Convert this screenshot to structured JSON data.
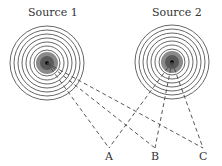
{
  "sources": [
    {
      "label": "Source 1",
      "cx": 47,
      "cy": 63
    },
    {
      "label": "Source 2",
      "cx": 172,
      "cy": 62
    }
  ],
  "points": [
    {
      "label": "A",
      "x": 109,
      "y": 148
    },
    {
      "label": "B",
      "x": 155,
      "y": 148
    },
    {
      "label": "C",
      "x": 203,
      "y": 148
    }
  ],
  "ring_radii": [
    13,
    17,
    21,
    25,
    29,
    33,
    37
  ],
  "colors": {
    "line": "#444444",
    "core_outer": "#8a8a8a",
    "core_inner": "#5a5a5a"
  }
}
